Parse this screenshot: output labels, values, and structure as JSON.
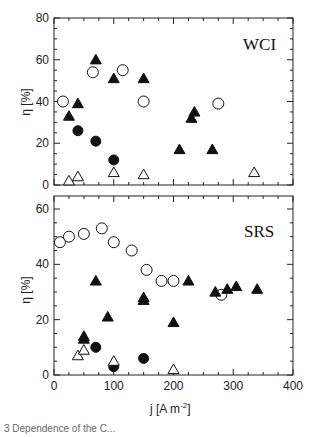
{
  "chart_data": [
    {
      "type": "scatter",
      "panel": "top",
      "label": "WCI",
      "xlabel": "j [A m^-2]",
      "ylabel": "η [%]",
      "xlim": [
        0,
        400
      ],
      "ylim": [
        0,
        80
      ],
      "yticks": [
        0,
        20,
        40,
        60,
        80
      ],
      "grid": false,
      "series": [
        {
          "name": "open-circle",
          "marker": "circle-open",
          "x": [
            15,
            65,
            115,
            150,
            275
          ],
          "y": [
            40,
            54,
            55,
            40,
            39
          ]
        },
        {
          "name": "filled-triangle",
          "marker": "triangle-filled",
          "x": [
            25,
            40,
            70,
            100,
            150,
            210,
            230,
            235,
            265
          ],
          "y": [
            33,
            39,
            60,
            51,
            51,
            17,
            32,
            35,
            17
          ]
        },
        {
          "name": "filled-circle",
          "marker": "circle-filled",
          "x": [
            40,
            70,
            100
          ],
          "y": [
            26,
            21,
            12
          ]
        },
        {
          "name": "open-triangle",
          "marker": "triangle-open",
          "x": [
            25,
            40,
            100,
            150,
            335
          ],
          "y": [
            2,
            4,
            6,
            5,
            6
          ]
        }
      ]
    },
    {
      "type": "scatter",
      "panel": "bottom",
      "label": "SRS",
      "xlabel": "j [A m^-2]",
      "ylabel": "η [%]",
      "xlim": [
        0,
        400
      ],
      "ylim": [
        0,
        60
      ],
      "xticks": [
        0,
        100,
        200,
        300,
        400
      ],
      "yticks": [
        0,
        20,
        40,
        60
      ],
      "grid": false,
      "series": [
        {
          "name": "open-circle",
          "marker": "circle-open",
          "x": [
            10,
            25,
            50,
            80,
            100,
            130,
            155,
            180,
            200,
            280
          ],
          "y": [
            48,
            50,
            51,
            53,
            48,
            45,
            38,
            34,
            34,
            29
          ]
        },
        {
          "name": "filled-triangle",
          "marker": "triangle-filled",
          "x": [
            50,
            50,
            70,
            90,
            150,
            150,
            200,
            225,
            270,
            290,
            305,
            340
          ],
          "y": [
            13,
            14,
            34,
            21,
            28,
            27,
            19,
            34,
            30,
            31,
            32,
            31
          ]
        },
        {
          "name": "filled-circle",
          "marker": "circle-filled",
          "x": [
            70,
            100,
            150
          ],
          "y": [
            10,
            3,
            6
          ]
        },
        {
          "name": "open-triangle",
          "marker": "triangle-open",
          "x": [
            40,
            50,
            100,
            200
          ],
          "y": [
            7,
            9,
            5,
            2
          ]
        }
      ]
    }
  ],
  "axis": {
    "x_title": "j [A m",
    "x_title_sup": "-2",
    "x_title_end": "]",
    "y_title": "η [%]",
    "x_tick_labels": [
      "0",
      "100",
      "200",
      "300",
      "400"
    ],
    "top_y_tick_labels": [
      "0",
      "20",
      "40",
      "60",
      "80"
    ],
    "bottom_y_tick_labels": [
      "0",
      "20",
      "40",
      "60"
    ]
  },
  "panels": {
    "top_label": "WCI",
    "bottom_label": "SRS"
  },
  "caption": "3 Dependence of the C..."
}
